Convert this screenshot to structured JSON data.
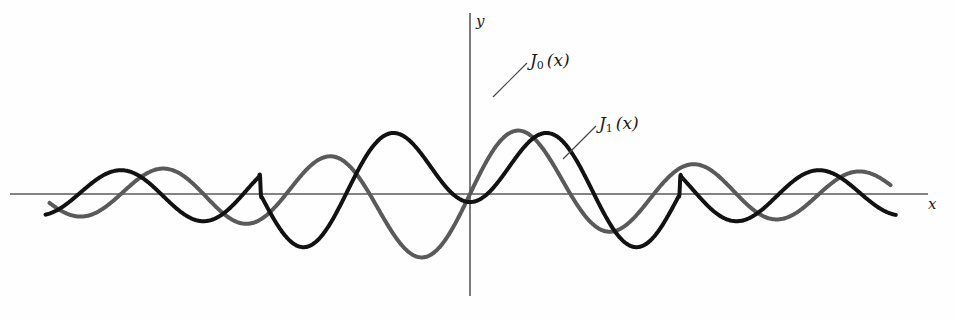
{
  "figure": {
    "title": "",
    "background_color": "#fefefe"
  },
  "axes": {
    "x_axis_label": "x",
    "y_axis_label": "y",
    "x_axis_color": "#5a5a5a",
    "y_axis_color": "#5a5a5a",
    "grid": false,
    "tick_labels": []
  },
  "labels": {
    "j0": {
      "base": "J",
      "order": "0",
      "arg": "(x)"
    },
    "j1": {
      "base": "J",
      "order": "1",
      "arg": "(x)"
    }
  },
  "chart_data": {
    "type": "line",
    "title": "",
    "xlabel": "x",
    "ylabel": "y",
    "grid": false,
    "legend_position": "inline-annotation",
    "xlim": [
      -16.0,
      16.5
    ],
    "ylim": [
      -1.15,
      1.15
    ],
    "annotations": [
      {
        "text": "J_0(x)",
        "series": "J0(x)",
        "x": 0.9,
        "y": 0.99
      },
      {
        "text": "J_1(x)",
        "series": "J1(x)",
        "x": 4.95,
        "y": 0.66
      }
    ],
    "series": [
      {
        "name": "J0(x)",
        "color": "#121212",
        "line_width": 4.0,
        "description": "Bessel function of the first kind, order 0; even function, J0(0)=1",
        "key_points": {
          "maximum_at_origin": {
            "x": 0.0,
            "y": 1.0
          },
          "zeros": [
            2.405,
            5.52,
            8.654,
            11.792,
            14.931
          ],
          "extrema": [
            {
              "x": 3.832,
              "y": -0.403
            },
            {
              "x": 7.016,
              "y": 0.3
            },
            {
              "x": 10.173,
              "y": -0.25
            },
            {
              "x": 13.324,
              "y": 0.218
            }
          ]
        },
        "x": [
          -16.0,
          -15.5,
          -15.0,
          -14.5,
          -14.0,
          -13.5,
          -13.0,
          -12.5,
          -12.0,
          -11.5,
          -11.0,
          -10.5,
          -10.0,
          -9.5,
          -9.0,
          -8.5,
          -8.0,
          -7.5,
          -7.0,
          -6.5,
          -6.0,
          -5.5,
          -5.0,
          -4.5,
          -4.0,
          -3.5,
          -3.0,
          -2.5,
          -2.0,
          -1.5,
          -1.0,
          -0.5,
          0.0,
          0.5,
          1.0,
          1.5,
          2.0,
          2.5,
          3.0,
          3.5,
          4.0,
          4.5,
          5.0,
          5.5,
          6.0,
          6.5,
          7.0,
          7.5,
          8.0,
          8.5,
          9.0,
          9.5,
          10.0,
          10.5,
          11.0,
          11.5,
          12.0,
          12.5,
          13.0,
          13.5,
          14.0,
          14.5,
          15.0,
          15.5,
          16.0
        ],
        "values": [
          0.174,
          0.07,
          -0.014,
          -0.078,
          -0.118,
          -0.135,
          -0.127,
          -0.097,
          -0.047,
          0.009,
          0.071,
          0.123,
          0.172,
          0.21,
          0.234,
          0.242,
          0.235,
          0.212,
          0.176,
          0.127,
          0.071,
          0.01,
          -0.045,
          -0.102,
          -0.147,
          -0.176,
          -0.187,
          -0.17,
          -0.13,
          -0.071,
          0.002,
          0.08,
          0.16,
          0.23,
          0.291,
          0.337,
          0.367,
          0.379,
          0.371,
          0.343,
          0.297,
          0.235,
          0.16,
          0.076,
          -0.012,
          -0.1,
          -0.183,
          -0.256,
          -0.315,
          -0.357,
          -0.381,
          -0.385,
          -0.372,
          -0.341,
          -0.297,
          -0.241,
          -0.177,
          -0.109,
          -0.04,
          0.027,
          0.091,
          0.148,
          0.197,
          0.236,
          0.264
        ]
      },
      {
        "name": "J1(x)",
        "color": "#5a5a5a",
        "line_width": 4.0,
        "description": "Bessel function of the first kind, order 1; odd function, J1(0)=0",
        "key_points": {
          "value_at_origin": {
            "x": 0.0,
            "y": 0.0
          },
          "zeros": [
            0.0,
            3.832,
            7.016,
            10.173,
            13.324
          ],
          "extrema": [
            {
              "x": 1.841,
              "y": 0.582
            },
            {
              "x": 5.331,
              "y": -0.346
            },
            {
              "x": 8.536,
              "y": 0.273
            },
            {
              "x": 11.706,
              "y": -0.233
            },
            {
              "x": 14.864,
              "y": 0.207
            }
          ]
        },
        "x": [
          -16.0,
          -15.5,
          -15.0,
          -14.5,
          -14.0,
          -13.5,
          -13.0,
          -12.5,
          -12.0,
          -11.5,
          -11.0,
          -10.5,
          -10.0,
          -9.5,
          -9.0,
          -8.5,
          -8.0,
          -7.5,
          -7.0,
          -6.5,
          -6.0,
          -5.5,
          -5.0,
          -4.5,
          -4.0,
          -3.5,
          -3.0,
          -2.5,
          -2.0,
          -1.5,
          -1.0,
          -0.5,
          0.0,
          0.5,
          1.0,
          1.5,
          2.0,
          2.5,
          3.0,
          3.5,
          4.0,
          4.5,
          5.0,
          5.5,
          6.0,
          6.5,
          7.0,
          7.5,
          8.0,
          8.5,
          9.0,
          9.5,
          10.0,
          10.5,
          11.0,
          11.5,
          12.0,
          12.5,
          13.0,
          13.5,
          14.0,
          14.5,
          15.0,
          15.5,
          16.0
        ],
        "values": [
          -0.904,
          -0.845,
          -0.764,
          -0.664,
          -0.548,
          -0.42,
          -0.284,
          -0.144,
          -0.005,
          0.129,
          0.253,
          0.362,
          0.452,
          0.52,
          0.563,
          0.581,
          0.572,
          0.538,
          0.48,
          0.401,
          0.305,
          0.197,
          0.082,
          -0.034,
          -0.146,
          -0.247,
          -0.333,
          -0.398,
          -0.439,
          -0.455,
          -0.444,
          -0.386,
          0.0,
          0.386,
          0.444,
          0.455,
          0.439,
          0.398,
          0.333,
          0.247,
          0.146,
          0.034,
          -0.082,
          -0.197,
          -0.305,
          -0.401,
          -0.48,
          -0.538,
          -0.572,
          -0.581,
          -0.563,
          -0.52,
          -0.452,
          -0.362,
          -0.253,
          -0.129,
          0.005,
          0.144,
          0.284,
          0.42,
          0.548,
          0.664,
          0.764,
          0.845,
          0.904
        ]
      }
    ]
  }
}
